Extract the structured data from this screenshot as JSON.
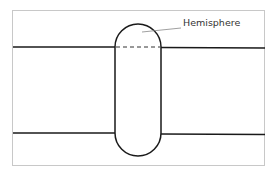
{
  "diagram": {
    "type": "cylindrical-tank-with-hemispherical-ends",
    "labels": {
      "hemisphere": "Hemisphere"
    },
    "colors": {
      "stroke": "#1a1a1a",
      "frame": "#c8c8c8",
      "leader": "#888888"
    }
  }
}
